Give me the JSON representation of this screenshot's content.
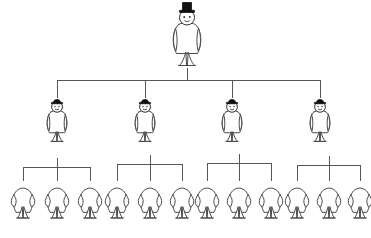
{
  "diagram": {
    "type": "tree-diagram",
    "background_color": "#ffffff",
    "line_color": "#55565a",
    "outline_color": "#4a4a4a",
    "hat_color": "#111111",
    "canvas": {
      "width": 371,
      "height": 238
    },
    "levels": [
      {
        "level": 1,
        "name": "root-level",
        "count": 1,
        "figure_style": "top-hat-figure",
        "hat": "tall-top-hat",
        "has_face": true,
        "baseline_y": 20,
        "nodes": [
          {
            "id": "root",
            "label": "",
            "cx": 187,
            "cy": 20
          }
        ]
      },
      {
        "level": 2,
        "name": "middle-level",
        "count": 4,
        "figure_style": "bowler-hat-figure",
        "hat": "bowler-hat",
        "has_face": true,
        "baseline_y": 112,
        "nodes": [
          {
            "id": "mid-1",
            "label": "",
            "cx": 57,
            "cy": 112
          },
          {
            "id": "mid-2",
            "label": "",
            "cx": 145,
            "cy": 112
          },
          {
            "id": "mid-3",
            "label": "",
            "cx": 232,
            "cy": 112
          },
          {
            "id": "mid-4",
            "label": "",
            "cx": 320,
            "cy": 112
          }
        ]
      },
      {
        "level": 3,
        "name": "leaf-level",
        "count": 12,
        "figure_style": "plain-figure",
        "hat": "none",
        "has_face": false,
        "baseline_y": 190,
        "nodes": [
          {
            "id": "leaf-1",
            "label": "",
            "cx": 23,
            "cy": 190,
            "parent": "mid-1"
          },
          {
            "id": "leaf-2",
            "label": "",
            "cx": 57,
            "cy": 190,
            "parent": "mid-1"
          },
          {
            "id": "leaf-3",
            "label": "",
            "cx": 90,
            "cy": 190,
            "parent": "mid-1"
          },
          {
            "id": "leaf-4",
            "label": "",
            "cx": 117,
            "cy": 190,
            "parent": "mid-2"
          },
          {
            "id": "leaf-5",
            "label": "",
            "cx": 150,
            "cy": 190,
            "parent": "mid-2"
          },
          {
            "id": "leaf-6",
            "label": "",
            "cx": 182,
            "cy": 190,
            "parent": "mid-2"
          },
          {
            "id": "leaf-7",
            "label": "",
            "cx": 207,
            "cy": 190,
            "parent": "mid-3"
          },
          {
            "id": "leaf-8",
            "label": "",
            "cx": 239,
            "cy": 190,
            "parent": "mid-3"
          },
          {
            "id": "leaf-9",
            "label": "",
            "cx": 271,
            "cy": 190,
            "parent": "mid-3"
          },
          {
            "id": "leaf-10",
            "label": "",
            "cx": 297,
            "cy": 190,
            "parent": "mid-4"
          },
          {
            "id": "leaf-11",
            "label": "",
            "cx": 329,
            "cy": 190,
            "parent": "mid-4"
          },
          {
            "id": "leaf-12",
            "label": "",
            "cx": 360,
            "cy": 190,
            "parent": "mid-4"
          }
        ]
      }
    ],
    "connectors": {
      "root_stem": {
        "x": 187,
        "y1": 68,
        "y2": 80
      },
      "level2_bar": {
        "y": 80,
        "x1": 57,
        "x2": 320
      },
      "level2_drops": [
        {
          "x": 57,
          "y1": 80,
          "y2": 98
        },
        {
          "x": 145,
          "y1": 80,
          "y2": 98
        },
        {
          "x": 232,
          "y1": 80,
          "y2": 98
        },
        {
          "x": 320,
          "y1": 80,
          "y2": 98
        }
      ],
      "level3_brackets": [
        {
          "parent": "mid-1",
          "bar_y": 167,
          "x1": 23,
          "x2": 90,
          "stem_x": 57,
          "stem_top": 158,
          "drop_to": 181
        },
        {
          "parent": "mid-2",
          "bar_y": 164,
          "x1": 117,
          "x2": 182,
          "stem_x": 150,
          "stem_top": 155,
          "drop_to": 181
        },
        {
          "parent": "mid-3",
          "bar_y": 163,
          "x1": 207,
          "x2": 271,
          "stem_x": 239,
          "stem_top": 154,
          "drop_to": 181
        },
        {
          "parent": "mid-4",
          "bar_y": 165,
          "x1": 297,
          "x2": 360,
          "stem_x": 329,
          "stem_top": 156,
          "drop_to": 181
        }
      ]
    }
  }
}
